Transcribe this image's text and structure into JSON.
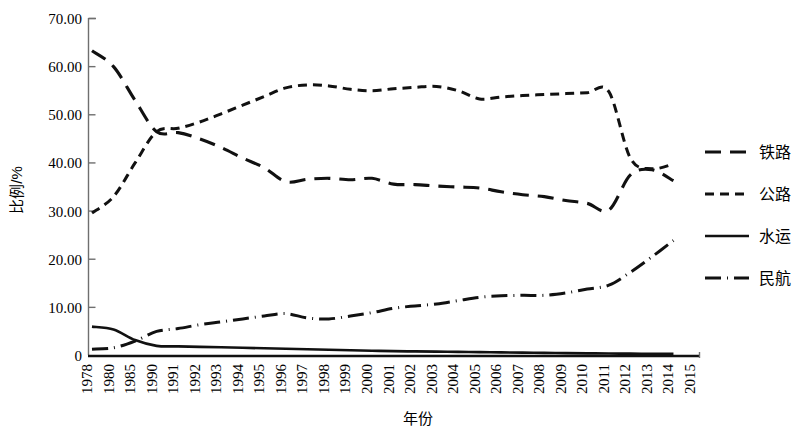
{
  "chart_data": {
    "type": "line",
    "title": "",
    "xlabel": "年份",
    "ylabel": "比例/%",
    "x": [
      1978,
      1980,
      1985,
      1990,
      1991,
      1992,
      1993,
      1994,
      1995,
      1996,
      1997,
      1998,
      1999,
      2000,
      2001,
      2002,
      2003,
      2004,
      2005,
      2006,
      2007,
      2008,
      2009,
      2010,
      2011,
      2012,
      2013,
      2014,
      2015
    ],
    "xtick_labels": [
      "1978",
      "1980",
      "1985",
      "1990",
      "1991",
      "1992",
      "1993",
      "1994",
      "1995",
      "1996",
      "1997",
      "1998",
      "1999",
      "2000",
      "2001",
      "2002",
      "2003",
      "2004",
      "2005",
      "2006",
      "2007",
      "2008",
      "2009",
      "2010",
      "2011",
      "2012",
      "2013",
      "2014",
      "2015"
    ],
    "ytick_labels": [
      "0",
      "10.00",
      "20.00",
      "30.00",
      "40.00",
      "50.00",
      "60.00",
      "70.00"
    ],
    "ytick_values": [
      0,
      10,
      20,
      30,
      40,
      50,
      60,
      70
    ],
    "ylim": [
      0,
      70
    ],
    "grid": false,
    "legend_position": "right",
    "series": [
      {
        "name": "铁路",
        "dash": "long-dash",
        "values": [
          63.3,
          60.0,
          53.0,
          46.5,
          46.3,
          45.0,
          43.2,
          41.0,
          39.0,
          36.1,
          36.6,
          36.8,
          36.5,
          36.8,
          35.6,
          35.5,
          35.2,
          35.0,
          34.8,
          34.0,
          33.4,
          33.0,
          32.2,
          31.6,
          30.2,
          37.5,
          38.6,
          36.3,
          null
        ]
      },
      {
        "name": "公路",
        "dash": "short-dash",
        "values": [
          29.6,
          33.0,
          40.0,
          46.5,
          47.2,
          48.5,
          50.2,
          52.0,
          53.8,
          55.6,
          56.2,
          56.0,
          55.3,
          55.0,
          55.4,
          55.7,
          55.9,
          55.0,
          53.3,
          53.7,
          54.0,
          54.2,
          54.4,
          54.6,
          54.8,
          41.0,
          38.8,
          39.8,
          null
        ]
      },
      {
        "name": "水运",
        "dash": "solid",
        "values": [
          6.0,
          5.4,
          3.2,
          2.0,
          1.9,
          1.8,
          1.7,
          1.6,
          1.5,
          1.4,
          1.3,
          1.2,
          1.1,
          1.0,
          0.9,
          0.85,
          0.8,
          0.75,
          0.7,
          0.65,
          0.6,
          0.55,
          0.5,
          0.45,
          0.4,
          0.38,
          0.35,
          0.33,
          null
        ]
      },
      {
        "name": "民航",
        "dash": "dash-dot",
        "values": [
          1.3,
          1.6,
          3.0,
          5.0,
          5.6,
          6.4,
          7.0,
          7.6,
          8.2,
          8.7,
          7.8,
          7.6,
          8.2,
          8.9,
          9.8,
          10.3,
          10.7,
          11.4,
          12.1,
          12.4,
          12.5,
          12.5,
          13.0,
          13.8,
          14.6,
          17.3,
          20.5,
          23.9,
          null
        ]
      }
    ],
    "legend_items": [
      {
        "label": "铁路",
        "dash": "long-dash"
      },
      {
        "label": "公路",
        "dash": "short-dash"
      },
      {
        "label": "水运",
        "dash": "solid"
      },
      {
        "label": "民航",
        "dash": "dash-dot"
      }
    ]
  }
}
